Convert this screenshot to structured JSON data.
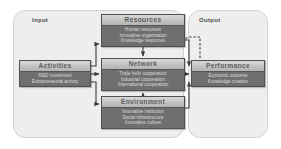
{
  "diagram": {
    "panels": [
      {
        "id": "input",
        "label": "Input"
      },
      {
        "id": "output",
        "label": "Output"
      }
    ],
    "colors": {
      "panel_fill": "#eeeeee",
      "panel_border": "#d2d2d2",
      "box_body": "#6f6f6f",
      "box_header": "#c8c8c8",
      "box_border": "#4f4f4f",
      "header_text": "#5c5c5c",
      "item_text": "#dcdcdc",
      "arrow": "#3a3a3a",
      "background": "#ffffff"
    },
    "boxes": [
      {
        "id": "resources",
        "title": "Resources",
        "items": [
          "Human resources",
          "Innovative organization",
          "Knowledge resources"
        ]
      },
      {
        "id": "activities",
        "title": "Activities",
        "items": [
          "R&D investment",
          "Entrepreneurial activity"
        ]
      },
      {
        "id": "network",
        "title": "Network",
        "items": [
          "Triple helix cooperation",
          "Industrial cooperation",
          "International cooperation"
        ]
      },
      {
        "id": "performance",
        "title": "Performance",
        "items": [
          "Economic outcome",
          "Knowledge creation"
        ]
      },
      {
        "id": "environment",
        "title": "Environment",
        "items": [
          "Innovative institution",
          "Social infrastructure",
          "Innovative culture"
        ]
      }
    ],
    "connections": [
      {
        "from": "activities",
        "to": "resources",
        "style": "solid"
      },
      {
        "from": "activities",
        "to": "network",
        "style": "solid"
      },
      {
        "from": "activities",
        "to": "environment",
        "style": "solid"
      },
      {
        "from": "resources",
        "to": "network",
        "style": "solid"
      },
      {
        "from": "environment",
        "to": "network",
        "style": "solid"
      },
      {
        "from": "resources",
        "to": "performance",
        "style": "solid"
      },
      {
        "from": "network",
        "to": "performance",
        "style": "solid"
      },
      {
        "from": "environment",
        "to": "performance",
        "style": "solid"
      },
      {
        "from": "performance",
        "to": "resources",
        "style": "dashed"
      }
    ]
  }
}
